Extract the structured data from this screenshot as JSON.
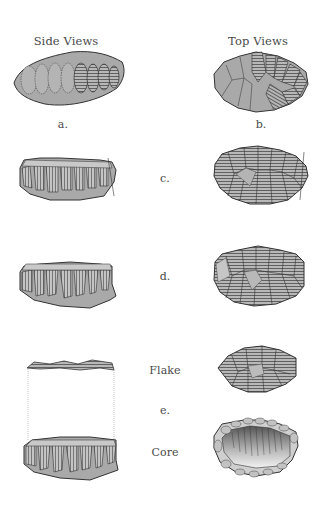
{
  "headers": {
    "side": "Side Views",
    "top": "Top Views"
  },
  "labels": {
    "a": "a.",
    "b": "b.",
    "c": "c.",
    "d": "d.",
    "e": "e.",
    "flake": "Flake",
    "core": "Core"
  },
  "colors": {
    "fill": "#a9a9a9",
    "stroke": "#3a3a3a",
    "hatch": "#555555",
    "light": "#d8d8d8",
    "text": "#4a4a4a"
  }
}
